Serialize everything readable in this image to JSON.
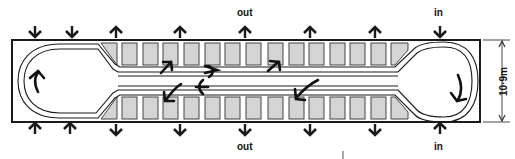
{
  "diagram": {
    "labels": {
      "top_out": "out",
      "top_in": "in",
      "bottom_out": "out",
      "bottom_in": "in",
      "dimension": "10·9m"
    },
    "colors": {
      "line": "#1a1a1a",
      "bay_fill": "#d4d4d4",
      "bay_stroke": "#333333",
      "background": "#ffffff"
    },
    "outer_rect": {
      "x": 12,
      "y": 40,
      "width": 468,
      "height": 82
    },
    "top_arrows": [
      {
        "x": 35,
        "direction": "down"
      },
      {
        "x": 72,
        "direction": "down"
      },
      {
        "x": 116,
        "direction": "up"
      },
      {
        "x": 180,
        "direction": "up"
      },
      {
        "x": 245,
        "direction": "up",
        "label": "out"
      },
      {
        "x": 310,
        "direction": "up"
      },
      {
        "x": 375,
        "direction": "up"
      },
      {
        "x": 440,
        "direction": "down",
        "label": "in"
      }
    ],
    "bottom_arrows": [
      {
        "x": 35,
        "direction": "up"
      },
      {
        "x": 70,
        "direction": "up"
      },
      {
        "x": 116,
        "direction": "down"
      },
      {
        "x": 180,
        "direction": "down"
      },
      {
        "x": 245,
        "direction": "down",
        "label": "out"
      },
      {
        "x": 310,
        "direction": "down"
      },
      {
        "x": 375,
        "direction": "down"
      },
      {
        "x": 440,
        "direction": "up",
        "label": "in"
      }
    ],
    "top_bays_count": 15,
    "bottom_bays_count": 15
  }
}
